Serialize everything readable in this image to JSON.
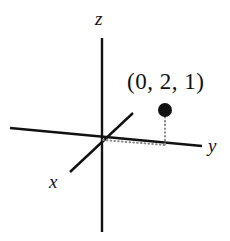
{
  "figure": {
    "width": 230,
    "height": 241,
    "background_color": "#ffffff",
    "stroke_color": "#111111",
    "dotted_color": "#8a8a8a"
  },
  "axes": {
    "z": {
      "label": "z",
      "x1": 102,
      "y1": 38,
      "x2": 102,
      "y2": 232
    },
    "y": {
      "label": "y",
      "x1": 10,
      "y1": 128,
      "x2": 202,
      "y2": 146
    },
    "x": {
      "label": "x",
      "x1": 70,
      "y1": 172,
      "x2": 133,
      "y2": 113
    },
    "origin": {
      "x": 102,
      "y": 140
    }
  },
  "point": {
    "label": "(0, 2, 1)",
    "coordinates": [
      0,
      2,
      1
    ],
    "marker": {
      "cx": 165,
      "cy": 110,
      "r": 7,
      "fill": "#111111"
    },
    "projection": {
      "x": 165,
      "y": 145
    },
    "guides": {
      "vertical": {
        "x1": 165,
        "y1": 117,
        "x2": 165,
        "y2": 145
      },
      "horizontal": {
        "x1": 103,
        "y1": 140,
        "x2": 165,
        "y2": 145
      }
    }
  }
}
